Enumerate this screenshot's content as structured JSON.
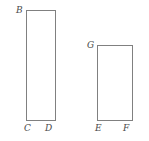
{
  "figure": {
    "type": "geometry-diagram",
    "background_color": "#ffffff",
    "stroke_color": "#808080",
    "label_color": "#4a4a4a",
    "canvas": {
      "width": 149,
      "height": 141
    },
    "shapes": [
      {
        "name": "tall-rectangle",
        "x": 26,
        "y": 10,
        "width": 30,
        "height": 111,
        "labels": [
          "B",
          "C",
          "D"
        ]
      },
      {
        "name": "short-rectangle",
        "x": 97,
        "y": 45,
        "width": 36,
        "height": 76,
        "labels": [
          "G",
          "E",
          "F"
        ]
      }
    ],
    "labels": {
      "b": "B",
      "c": "C",
      "d": "D",
      "g": "G",
      "e": "E",
      "f": "F"
    }
  }
}
